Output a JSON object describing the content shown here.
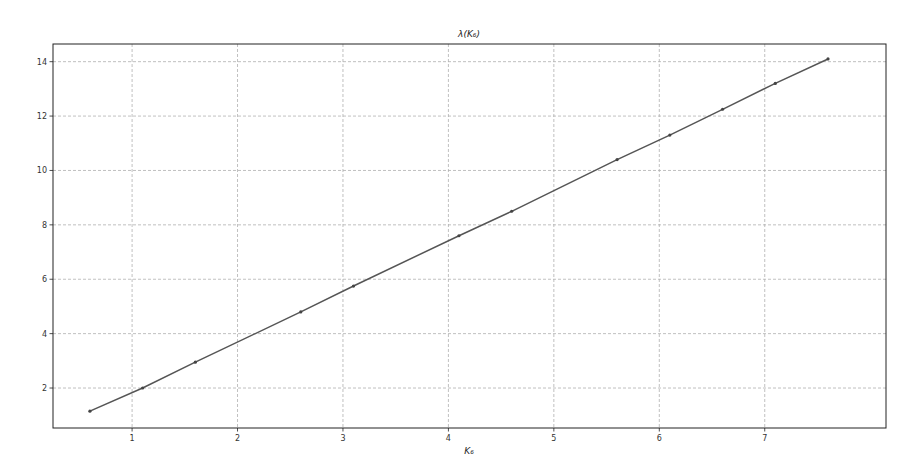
{
  "chart_data": {
    "type": "line",
    "title": "λ(K₆)",
    "xlabel": "K₆",
    "ylabel": "",
    "x": [
      0.6,
      1.1,
      1.6,
      2.6,
      3.1,
      4.1,
      4.6,
      5.6,
      6.1,
      6.6,
      7.1,
      7.6
    ],
    "series": [
      {
        "name": "λ(K₆)",
        "values": [
          1.15,
          2.0,
          2.95,
          4.8,
          5.75,
          7.6,
          8.5,
          10.4,
          11.3,
          12.25,
          13.2,
          14.1
        ],
        "color": "#555555",
        "marker": "point"
      }
    ],
    "xlim": [
      0.25,
      8.15
    ],
    "ylim": [
      0.53,
      14.65
    ],
    "xticks": [
      1,
      2,
      3,
      4,
      5,
      6,
      7
    ],
    "yticks": [
      2,
      4,
      6,
      8,
      10,
      12,
      14
    ],
    "grid": true,
    "legend": null
  },
  "colors": {
    "line": "#555555",
    "marker": "#444444",
    "grid": "#b0b0b0",
    "axes": "#222222",
    "background": "#ffffff"
  }
}
